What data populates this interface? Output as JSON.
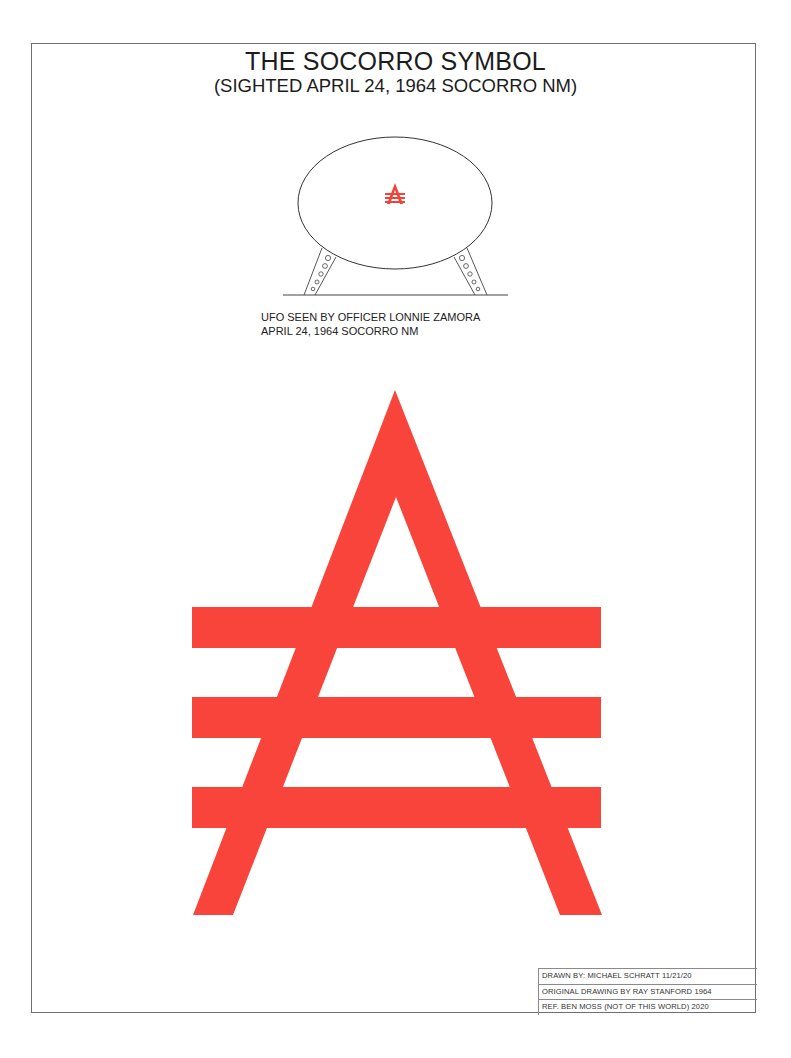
{
  "document": {
    "title": "THE SOCORRO SYMBOL",
    "subtitle": "(SIGHTED APRIL 24, 1964 SOCORRO NM)"
  },
  "ufo_illustration": {
    "caption_line1": "UFO SEEN BY OFFICER LONNIE ZAMORA",
    "caption_line2": "APRIL 24, 1964 SOCORRO NM",
    "outline_color": "#333333",
    "emblem_color": "#f2423a"
  },
  "symbol": {
    "name": "socorro-insignia",
    "description": "Red inverted-V (triangle/A shape) crossed by three horizontal bars",
    "color": "#f8443a",
    "bar_count": 3
  },
  "title_block": {
    "rows": [
      "DRAWN BY: MICHAEL SCHRATT 11/21/20",
      "ORIGINAL DRAWING BY RAY STANFORD 1964",
      "REF. BEN MOSS (NOT OF THIS WORLD) 2020"
    ]
  }
}
